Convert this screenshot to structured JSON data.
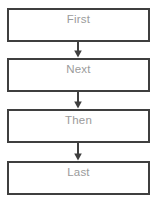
{
  "diagram": {
    "type": "vertical-flowchart",
    "orientation": "top-to-bottom",
    "style": {
      "background_color": "#ffffff",
      "box_fill_color": "#ffffff",
      "box_border_color": "#3f3f3f",
      "label_text_color": "#9b9b9b",
      "arrow_color": "#3f3f3f"
    },
    "nodes": [
      {
        "id": "node-1",
        "label": "First"
      },
      {
        "id": "node-2",
        "label": "Next"
      },
      {
        "id": "node-3",
        "label": "Then"
      },
      {
        "id": "node-4",
        "label": "Last"
      }
    ],
    "connectors": [
      {
        "id": "conn-1",
        "from": "node-1",
        "to": "node-2",
        "icon": "arrow-down-icon"
      },
      {
        "id": "conn-2",
        "from": "node-2",
        "to": "node-3",
        "icon": "arrow-down-icon"
      },
      {
        "id": "conn-3",
        "from": "node-3",
        "to": "node-4",
        "icon": "arrow-down-icon"
      }
    ]
  }
}
